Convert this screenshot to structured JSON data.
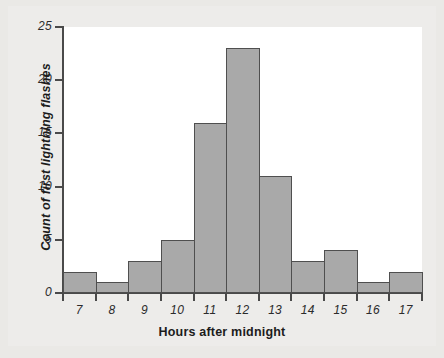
{
  "chart_data": {
    "type": "bar",
    "title": "",
    "xlabel": "Hours after midnight",
    "ylabel": "Count of first lightning flashes",
    "categories": [
      "7",
      "8",
      "9",
      "10",
      "11",
      "12",
      "13",
      "14",
      "15",
      "16",
      "17"
    ],
    "values": [
      2,
      1,
      3,
      5,
      16,
      23,
      11,
      3,
      4,
      1,
      2
    ],
    "ylim": [
      0,
      25
    ],
    "y_ticks": [
      "0",
      "5",
      "10",
      "15",
      "20",
      "25"
    ],
    "y_tick_values": [
      0,
      5,
      10,
      15,
      20,
      25
    ],
    "x_tick_labels": [
      "7",
      "8",
      "9",
      "10",
      "11",
      "12",
      "13",
      "14",
      "15",
      "16",
      "17"
    ],
    "grid": false,
    "legend": null,
    "bin_width": 1,
    "bin_edges": [
      6.5,
      7.5,
      8.5,
      9.5,
      10.5,
      11.5,
      12.5,
      13.5,
      14.5,
      15.5,
      16.5,
      17.5
    ]
  },
  "style": {
    "page_background": "#eae9e6",
    "plot_background": "#ffffff",
    "bar_fill": "#a9a9a9",
    "bar_stroke": "#4f4f4f",
    "axis_color": "#4a4a4a",
    "text_color": "#1c1c1c"
  }
}
